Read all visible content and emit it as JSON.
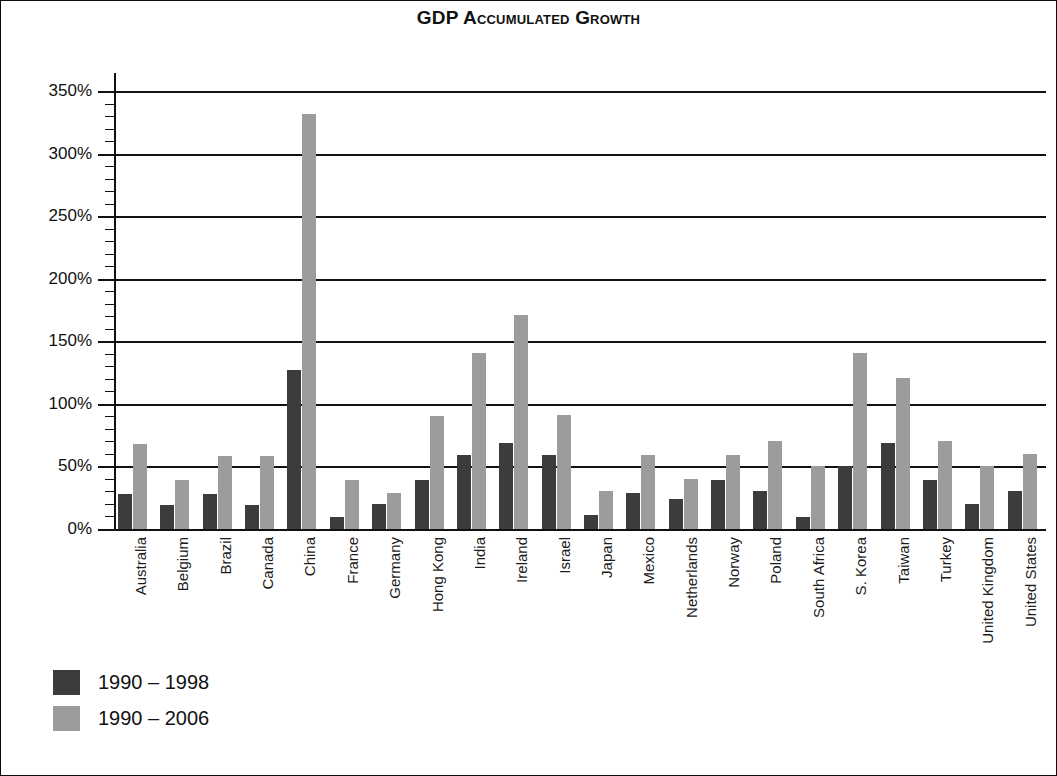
{
  "chart_data": {
    "type": "bar",
    "title": "GDP Accumulated Growth",
    "xlabel": "",
    "ylabel": "",
    "ylim": [
      0,
      350
    ],
    "ytick_step": 50,
    "yminor_step": 10,
    "ytick_labels": [
      "0%",
      "50%",
      "100%",
      "150%",
      "200%",
      "250%",
      "300%",
      "350%"
    ],
    "ytick_values": [
      0,
      50,
      100,
      150,
      200,
      250,
      300,
      350
    ],
    "grid": "horizontal",
    "legend_position": "below-left",
    "categories": [
      "Australia",
      "Belgium",
      "Brazil",
      "Canada",
      "China",
      "France",
      "Germany",
      "Hong Kong",
      "India",
      "Ireland",
      "Israel",
      "Japan",
      "Mexico",
      "Netherlands",
      "Norway",
      "Poland",
      "South Africa",
      "S. Korea",
      "Taiwan",
      "Turkey",
      "United Kingdom",
      "United States"
    ],
    "series": [
      {
        "name": "1990 – 1998",
        "color": "#3c3c3c",
        "values": [
          28,
          19,
          28,
          19,
          127,
          10,
          20,
          39,
          59,
          69,
          59,
          11,
          29,
          24,
          39,
          30,
          10,
          50,
          69,
          39,
          20,
          30
        ]
      },
      {
        "name": "1990 – 2006",
        "color": "#9c9c9c",
        "values": [
          68,
          39,
          58,
          58,
          332,
          39,
          29,
          90,
          141,
          171,
          91,
          30,
          59,
          40,
          59,
          70,
          50,
          141,
          121,
          70,
          50,
          60
        ]
      }
    ]
  },
  "legend": {
    "items": [
      {
        "label": "1990 – 1998",
        "color": "#3c3c3c"
      },
      {
        "label": "1990 – 2006",
        "color": "#9c9c9c"
      }
    ]
  }
}
